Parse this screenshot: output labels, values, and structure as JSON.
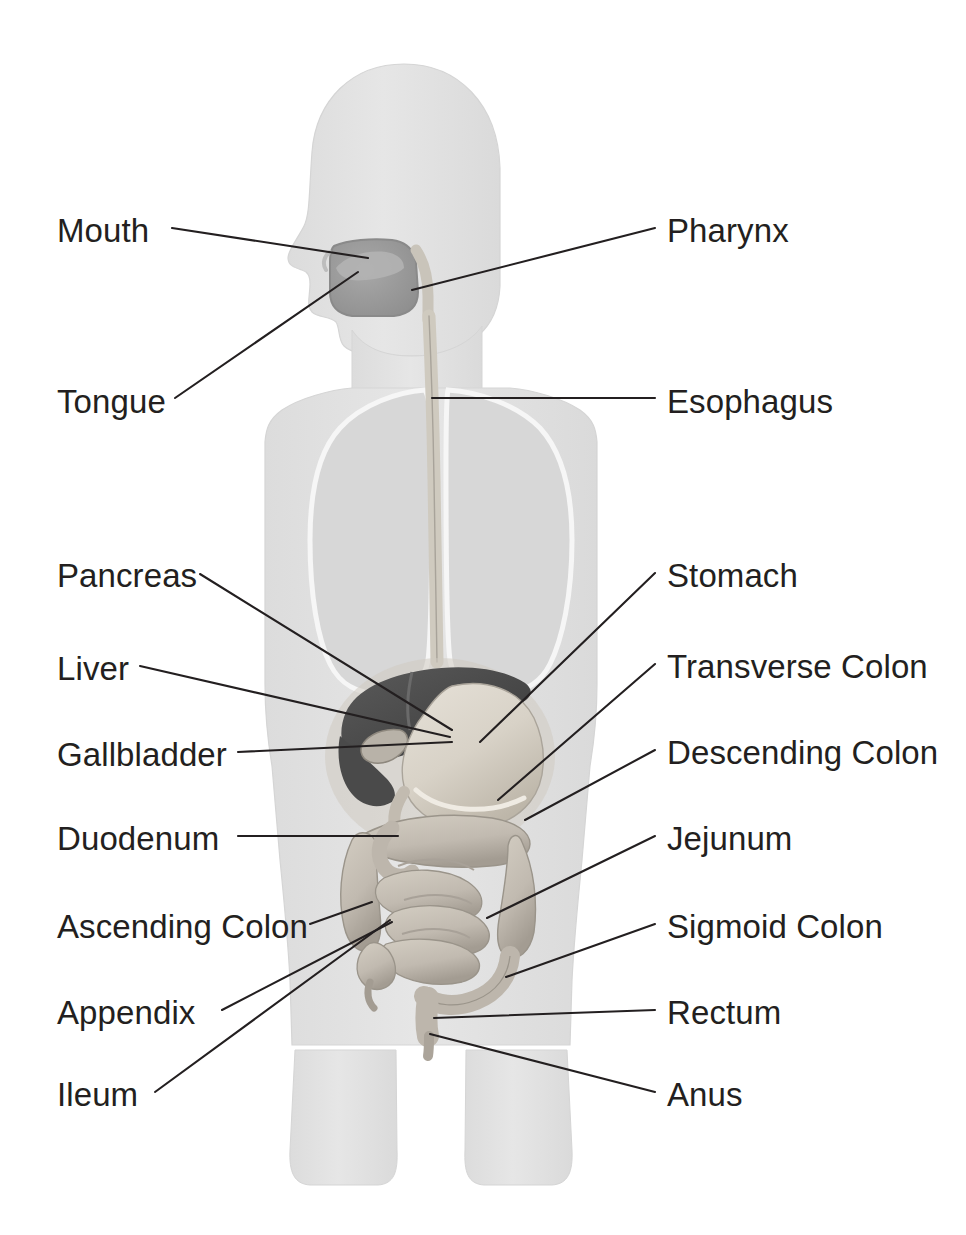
{
  "figure": {
    "kind": "anatomical-diagram",
    "view": "anterior body silhouette with head in left profile",
    "background_color": "#ffffff",
    "label_text_color": "#231f20",
    "leader_line_color": "#231f20",
    "body_silhouette_color": "#e3e3e3",
    "body_outline_color": "#d5d5d5",
    "lung_fill_color": "#d7d7d7",
    "lung_outline_color": "#f4f4f4",
    "oral_cavity_color": "#9a9a9a",
    "liver_color": "#4d4d4d",
    "gallbladder_color": "#8a8a8a",
    "stomach_color": "#d9d4cc",
    "intestine_color": "#c9c3b8",
    "intestine_shadow_color": "#9e978b",
    "esophagus_color": "#cfcabf"
  },
  "labels": {
    "left": [
      {
        "id": "mouth",
        "text": "Mouth",
        "x": 57,
        "y": 214
      },
      {
        "id": "tongue",
        "text": "Tongue",
        "x": 57,
        "y": 385
      },
      {
        "id": "pancreas",
        "text": "Pancreas",
        "x": 57,
        "y": 559
      },
      {
        "id": "liver",
        "text": "Liver",
        "x": 57,
        "y": 652
      },
      {
        "id": "gallbladder",
        "text": "Gallbladder",
        "x": 57,
        "y": 738
      },
      {
        "id": "duodenum",
        "text": "Duodenum",
        "x": 57,
        "y": 822
      },
      {
        "id": "ascending-colon",
        "text": "Ascending Colon",
        "x": 57,
        "y": 910
      },
      {
        "id": "appendix",
        "text": "Appendix",
        "x": 57,
        "y": 996
      },
      {
        "id": "ileum",
        "text": "Ileum",
        "x": 57,
        "y": 1078
      }
    ],
    "right": [
      {
        "id": "pharynx",
        "text": "Pharynx",
        "x": 667,
        "y": 214
      },
      {
        "id": "esophagus",
        "text": "Esophagus",
        "x": 667,
        "y": 385
      },
      {
        "id": "stomach",
        "text": "Stomach",
        "x": 667,
        "y": 559
      },
      {
        "id": "transverse-colon",
        "text": "Transverse Colon",
        "x": 667,
        "y": 650
      },
      {
        "id": "descending-colon",
        "text": "Descending Colon",
        "x": 667,
        "y": 736
      },
      {
        "id": "jejunum",
        "text": "Jejunum",
        "x": 667,
        "y": 822
      },
      {
        "id": "sigmoid-colon",
        "text": "Sigmoid Colon",
        "x": 667,
        "y": 910
      },
      {
        "id": "rectum",
        "text": "Rectum",
        "x": 667,
        "y": 996
      },
      {
        "id": "anus",
        "text": "Anus",
        "x": 667,
        "y": 1078
      }
    ]
  },
  "leader_lines": [
    {
      "id": "mouth",
      "from": [
        172,
        228
      ],
      "to": [
        368,
        258
      ]
    },
    {
      "id": "tongue",
      "from": [
        175,
        398
      ],
      "to": [
        358,
        272
      ]
    },
    {
      "id": "pharynx",
      "from": [
        655,
        228
      ],
      "to": [
        412,
        290
      ]
    },
    {
      "id": "esophagus",
      "from": [
        655,
        398
      ],
      "to": [
        432,
        398
      ]
    },
    {
      "id": "pancreas",
      "from": [
        200,
        574
      ],
      "to": [
        452,
        730
      ]
    },
    {
      "id": "stomach",
      "from": [
        655,
        573
      ],
      "to": [
        480,
        742
      ]
    },
    {
      "id": "liver",
      "from": [
        140,
        666
      ],
      "to": [
        450,
        737
      ]
    },
    {
      "id": "transverse-colon",
      "from": [
        655,
        664
      ],
      "to": [
        498,
        800
      ]
    },
    {
      "id": "gallbladder",
      "from": [
        238,
        752
      ],
      "to": [
        452,
        742
      ]
    },
    {
      "id": "descending-colon",
      "from": [
        655,
        750
      ],
      "to": [
        525,
        820
      ]
    },
    {
      "id": "duodenum",
      "from": [
        238,
        836
      ],
      "to": [
        398,
        836
      ]
    },
    {
      "id": "jejunum",
      "from": [
        655,
        836
      ],
      "to": [
        487,
        918
      ]
    },
    {
      "id": "ascending-colon",
      "from": [
        310,
        924
      ],
      "to": [
        372,
        902
      ]
    },
    {
      "id": "sigmoid-colon",
      "from": [
        655,
        924
      ],
      "to": [
        506,
        977
      ]
    },
    {
      "id": "appendix",
      "from": [
        222,
        1010
      ],
      "to": [
        392,
        922
      ]
    },
    {
      "id": "rectum",
      "from": [
        655,
        1010
      ],
      "to": [
        434,
        1018
      ]
    },
    {
      "id": "ileum",
      "from": [
        155,
        1092
      ],
      "to": [
        390,
        920
      ]
    },
    {
      "id": "anus",
      "from": [
        655,
        1092
      ],
      "to": [
        430,
        1034
      ]
    }
  ]
}
